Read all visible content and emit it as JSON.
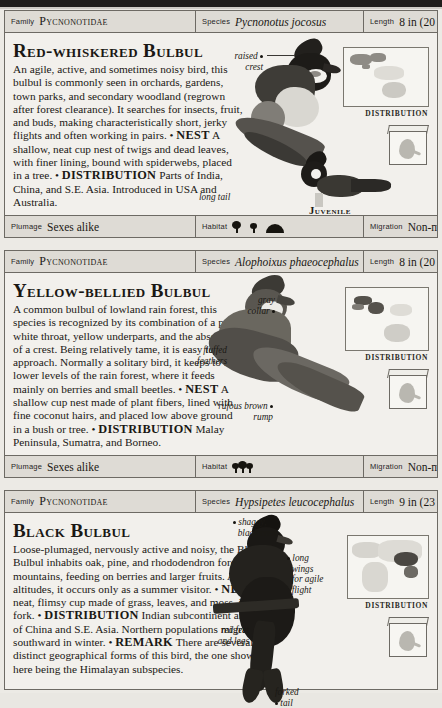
{
  "page": {
    "background_color": "#eceae5",
    "panel_color": "#f2f0ec",
    "strip_color": "#dedbd5"
  },
  "field_labels": {
    "family": "Family",
    "species": "Species",
    "length": "Length",
    "plumage": "Plumage",
    "habitat": "Habitat",
    "migration": "Migration"
  },
  "entries": [
    {
      "family": "Pycnonotidae",
      "species": "Pycnonotus jocosus",
      "length": "8 in (20 cm)",
      "title": "Red-whiskered Bulbul",
      "description": "An agile, active, and sometimes noisy bird, this bulbul is commonly seen in orchards, gardens, town parks, and secondary woodland (regrown after forest clearance). It searches for insects, fruit, and buds, making characteristically short, jerky flights and often working in pairs.",
      "nest_label": "NEST",
      "nest_text": "A shallow, neat cup nest of twigs and dead leaves, with finer lining, bound with spiderwebs, placed in a tree.",
      "distribution_label": "DISTRIBUTION",
      "distribution_text": "Parts of India, China, and S.E. Asia. Introduced in USA and Australia.",
      "plumage": "Sexes alike",
      "habitat_icons": [
        "tree-icon",
        "tree-icon",
        "hill-icon"
      ],
      "migration": "Non-migrant",
      "map_caption": "DISTRIBUTION",
      "callouts": [
        "raised crest",
        "long tail"
      ],
      "sublabel": "Juvenile"
    },
    {
      "family": "Pycnonotidae",
      "species": "Alophoixus phaeocephalus",
      "length": "8 in (20 cm)",
      "title": "Yellow-bellied Bulbul",
      "description": "A common bulbul of lowland rain forest, this species is recognized by its combination of a puffy white throat, yellow underparts, and the absence of a crest. Being relatively tame, it is easy to approach. Normally a solitary bird, it keeps to the lower levels of the rain forest, where it feeds mainly on berries and small beetles.",
      "nest_label": "NEST",
      "nest_text": "A shallow cup nest made of plant fibers, lined with fine coconut hairs, and placed low above ground in a bush or tree.",
      "distribution_label": "DISTRIBUTION",
      "distribution_text": "Malay Peninsula, Sumatra, and Borneo.",
      "plumage": "Sexes alike",
      "habitat_icons": [
        "forest-icon"
      ],
      "migration": "Non-migrant",
      "map_caption": "DISTRIBUTION",
      "callouts": [
        "gray collar",
        "fluffed feathers",
        "rufous brown rump"
      ],
      "sublabel": ""
    },
    {
      "family": "Pycnonotidae",
      "species": "Hypsipetes leucocephalus",
      "length": "9 in (23 cm)",
      "title": "Black Bulbul",
      "description": "Loose-plumaged, nervously active and noisy, the Black Bulbul inhabits oak, pine, and rhododendron forests in mountains, feeding on berries and larger fruits. At higher altitudes, it occurs only as a summer visitor.",
      "nest_label": "NEST",
      "nest_text": "A neat, flimsy cup made of grass, leaves, and moss, in a tree fork.",
      "distribution_label": "DISTRIBUTION",
      "distribution_text": "Indian subcontinent and parts of China and S.E. Asia. Northern populations migrate southward in winter.",
      "remark_label": "REMARK",
      "remark_text": "There are several distinct geographical forms of this bird, the one shown here being the Himalayan subspecies.",
      "plumage": "",
      "habitat_icons": [],
      "migration": "",
      "map_caption": "DISTRIBUTION",
      "callouts": [
        "shaggy, black crest",
        "long wings for agile flight",
        "red feet and legs",
        "forked tail"
      ],
      "sublabel": ""
    }
  ]
}
